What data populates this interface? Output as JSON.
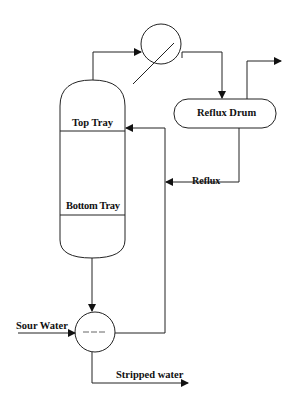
{
  "diagram": {
    "type": "process-flow-diagram",
    "title": "",
    "labels": {
      "top_tray": "Top Tray",
      "bottom_tray": "Bottom Tray",
      "reflux_drum": "Reflux Drum",
      "reflux": "Reflux",
      "sour_water": "Sour Water",
      "stripped_water": "Stripped water"
    },
    "nodes": [
      {
        "id": "column",
        "shape": "vertical-vessel",
        "label": ""
      },
      {
        "id": "condenser",
        "shape": "circle-with-diagonal",
        "label": ""
      },
      {
        "id": "reflux_drum",
        "shape": "rounded-rectangle",
        "label": "Reflux Drum"
      },
      {
        "id": "reboiler",
        "shape": "circle",
        "label": ""
      }
    ],
    "edges": [
      {
        "from": "column",
        "to": "condenser",
        "label": ""
      },
      {
        "from": "condenser",
        "to": "reflux_drum",
        "label": ""
      },
      {
        "from": "reflux_drum",
        "to": "overhead-out",
        "label": ""
      },
      {
        "from": "reflux_drum",
        "to": "column",
        "label": "Reflux"
      },
      {
        "from": "column",
        "to": "reboiler",
        "label": ""
      },
      {
        "from": "feed",
        "to": "reboiler",
        "label": "Sour Water"
      },
      {
        "from": "reboiler",
        "to": "product",
        "label": "Stripped water"
      }
    ],
    "colors": {
      "line": "#222222",
      "background": "#ffffff"
    }
  }
}
